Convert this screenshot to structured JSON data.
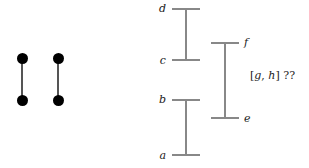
{
  "figure": {
    "type": "interval-order-diagram",
    "background_color": "#ffffff",
    "segment_color": "#555555",
    "bar_color": "#888888",
    "dot_color": "#000000",
    "label_color": "#1a1a1a"
  },
  "segments": {
    "description": "two vertical closed segments drawn with filled endpoint dots",
    "items": [
      {
        "name": "segment-1",
        "x": 22,
        "top_y": 58,
        "bottom_y": 100
      },
      {
        "name": "segment-2",
        "x": 58,
        "top_y": 58,
        "bottom_y": 100
      }
    ]
  },
  "intervals": {
    "description": "three vertical interval bars with horizontal end caps and endpoint labels",
    "items": [
      {
        "name": "interval-cd",
        "axis_x": 186,
        "top_y": 8,
        "bottom_y": 60,
        "cap_left": 172,
        "cap_right": 200,
        "top_label": "d",
        "bottom_label": "c",
        "label_side": "left"
      },
      {
        "name": "interval-ef",
        "axis_x": 225,
        "top_y": 42,
        "bottom_y": 118,
        "cap_left": 211,
        "cap_right": 239,
        "top_label": "f",
        "bottom_label": "e",
        "label_side": "right"
      },
      {
        "name": "interval-ab",
        "axis_x": 186,
        "top_y": 99,
        "bottom_y": 155,
        "cap_left": 172,
        "cap_right": 200,
        "top_label": "b",
        "bottom_label": "a",
        "label_side": "left"
      }
    ]
  },
  "annotation": {
    "name": "unknown-interval-note",
    "open_bracket": "[",
    "lower": "g",
    "separator": ",",
    "upper": "h",
    "close_bracket": "]",
    "query": "??",
    "full_text": "[g, h] ??",
    "x": 250,
    "y": 70
  },
  "labels": {
    "d": "d",
    "c": "c",
    "b": "b",
    "a": "a",
    "f": "f",
    "e": "e"
  }
}
